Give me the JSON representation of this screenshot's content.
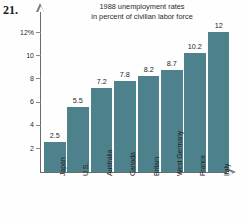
{
  "problem": {
    "number": "21."
  },
  "chart_data": {
    "type": "bar",
    "title": "1988 unemployment rates in percent of civilian labor force",
    "title_lines": [
      "1988 unemployment rates",
      "in percent of civilian labor force"
    ],
    "xlabel": "",
    "ylabel": "",
    "categories": [
      "Japan",
      "U.S.",
      "Australia",
      "Canada",
      "Britain",
      "West Germany",
      "France",
      "Italy"
    ],
    "values": [
      2.5,
      5.5,
      7.2,
      7.8,
      8.2,
      8.7,
      10.2,
      12
    ],
    "value_labels": [
      "2.5",
      "5.5",
      "7.2",
      "7.8",
      "8.2",
      "8.7",
      "10.2",
      "12"
    ],
    "ylim": [
      0,
      13
    ],
    "yticks": [
      2,
      4,
      6,
      8,
      10,
      12
    ],
    "ytick_labels": [
      "2",
      "4",
      "6",
      "8",
      "10",
      "12%"
    ],
    "grid": false,
    "legend": null,
    "bar_color": "#4d828c",
    "axis_color": "#6b6b6b",
    "text_color": "#1f1f1f"
  }
}
